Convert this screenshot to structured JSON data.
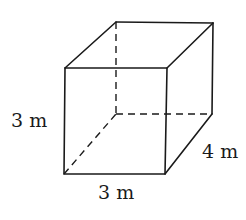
{
  "figure": {
    "type": "rectangular-prism",
    "stroke_color": "#1a1a1a",
    "background_color": "#ffffff",
    "vertices": {
      "front_top_left": [
        65,
        68
      ],
      "front_top_right": [
        167,
        68
      ],
      "front_bottom_left": [
        64,
        174
      ],
      "front_bottom_right": [
        165,
        174
      ],
      "back_top_left": [
        116,
        22
      ],
      "back_top_right": [
        213,
        23
      ],
      "back_bottom_left": [
        116,
        114
      ],
      "back_bottom_right": [
        212,
        114
      ]
    },
    "labels": {
      "height": "3 m",
      "depth": "4 m",
      "width": "3 m"
    }
  }
}
